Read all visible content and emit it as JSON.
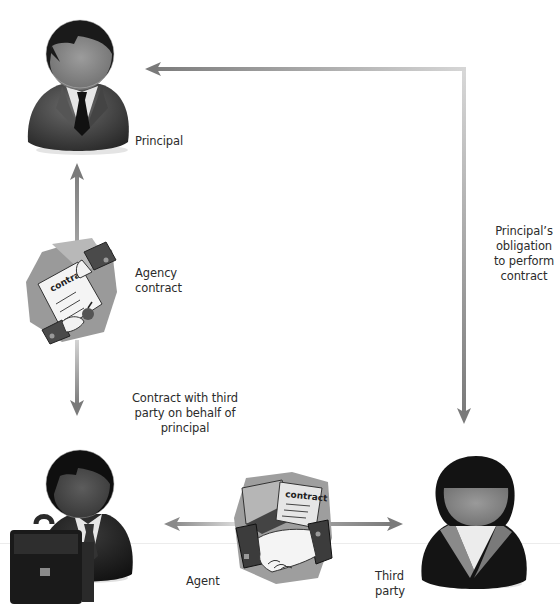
{
  "diagram": {
    "nodes": {
      "principal": {
        "label": "Principal",
        "icon": "businessman-icon"
      },
      "agent": {
        "label": "Agent",
        "icon": "businessman-with-briefcase-icon"
      },
      "third_party": {
        "label_line1": "Third",
        "label_line2": "party",
        "icon": "businesswoman-icon"
      }
    },
    "edges": {
      "agency_contract": {
        "from": "principal",
        "to": "agent",
        "label_line1": "Agency",
        "label_line2": "contract",
        "icon": "signed-contract-icon",
        "clipart_text": "contract"
      },
      "contract_with_third_party": {
        "from": "agent",
        "to": "third_party",
        "label_line1": "Contract with third",
        "label_line2": "party on behalf of",
        "label_line3": "principal",
        "icon": "handshake-contract-icon",
        "clipart_text": "contract"
      },
      "principal_obligation": {
        "from": "third_party",
        "to": "principal",
        "label_line1": "Principal’s",
        "label_line2": "obligation",
        "label_line3": "to perform",
        "label_line4": "contract"
      }
    },
    "colors": {
      "arrow": "#8a8a8a",
      "arrow_light": "#c8c8c8",
      "figure_dark": "#1e1e1e",
      "figure_mid": "#4a4a4a",
      "face": "#8c8c8c",
      "shirt": "#e8e8e8",
      "text": "#2b2b2b"
    }
  }
}
